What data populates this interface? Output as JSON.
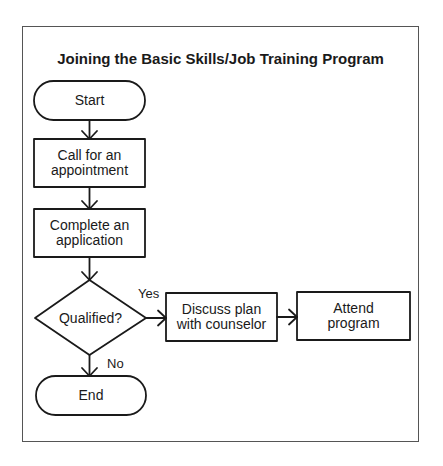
{
  "diagram": {
    "title": "Joining the Basic Skills/Job Training Program",
    "nodes": [
      {
        "id": "start",
        "type": "terminal",
        "label": "Start"
      },
      {
        "id": "call",
        "type": "process",
        "label": "Call for an appointment",
        "line1": "Call for an",
        "line2": "appointment"
      },
      {
        "id": "complete",
        "type": "process",
        "label": "Complete an application",
        "line1": "Complete an",
        "line2": "application"
      },
      {
        "id": "qualified",
        "type": "decision",
        "label": "Qualified?"
      },
      {
        "id": "discuss",
        "type": "process",
        "label": "Discuss plan with counselor",
        "line1": "Discuss plan",
        "line2": "with counselor"
      },
      {
        "id": "attend",
        "type": "process",
        "label": "Attend program",
        "line1": "Attend",
        "line2": "program"
      },
      {
        "id": "end",
        "type": "terminal",
        "label": "End"
      }
    ],
    "edges": [
      {
        "from": "start",
        "to": "call"
      },
      {
        "from": "call",
        "to": "complete"
      },
      {
        "from": "complete",
        "to": "qualified"
      },
      {
        "from": "qualified",
        "to": "discuss",
        "label": "Yes"
      },
      {
        "from": "discuss",
        "to": "attend"
      },
      {
        "from": "qualified",
        "to": "end",
        "label": "No"
      }
    ],
    "edge_labels": {
      "yes": "Yes",
      "no": "No"
    }
  }
}
